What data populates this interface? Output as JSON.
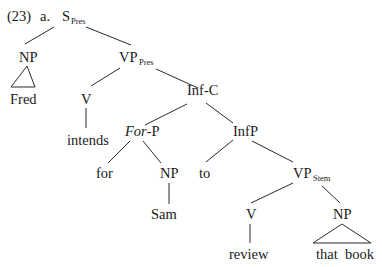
{
  "example": {
    "number": "(23)",
    "sub_label": "a."
  },
  "tree": {
    "root": {
      "label": "S",
      "subscript": "Pres"
    },
    "np_subject": {
      "label": "NP",
      "leaf": "Fred",
      "roof": true
    },
    "vp_pres": {
      "label": "VP",
      "subscript": "Pres"
    },
    "v_main": {
      "label": "V",
      "leaf": "intends"
    },
    "inf_c": {
      "label": "Inf-C"
    },
    "for_p": {
      "label_italic": "For",
      "label_rest": "-P"
    },
    "for": {
      "leaf": "for"
    },
    "np_sam": {
      "label": "NP",
      "leaf": "Sam"
    },
    "inf_p": {
      "label": "InfP"
    },
    "to": {
      "leaf": "to"
    },
    "vp_stem": {
      "label": "VP",
      "subscript": "Stem"
    },
    "v_review": {
      "label": "V",
      "leaf": "review"
    },
    "np_object": {
      "label": "NP",
      "leaf": "that  book",
      "roof": true
    }
  }
}
